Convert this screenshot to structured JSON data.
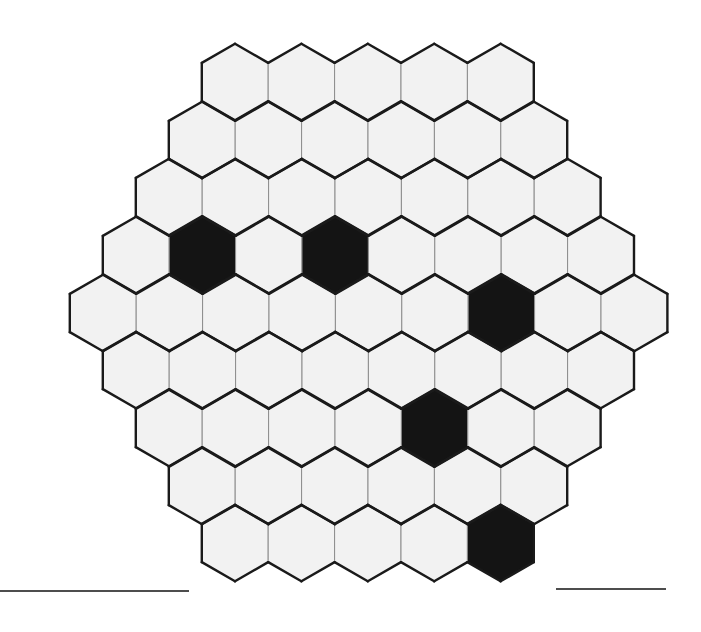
{
  "figure": {
    "canvas": {
      "width": 701,
      "height": 632,
      "background": "#ffffff"
    }
  },
  "style": {
    "cell_fill_empty": "#f2f2f2",
    "cell_fill_marked": "#141414",
    "interior_stroke": "#8c8c8c",
    "interior_stroke_width": 1,
    "boundary_stroke": "#1a1a1a",
    "boundary_stroke_width": 2.4,
    "rule_stroke": "#4d4d4d",
    "rule_stroke_width": 1.6
  },
  "geometry": {
    "orientation": "pointy-top",
    "circumradius": 38.3,
    "inradius": 33.2,
    "column_pitch": 66.4,
    "row_pitch": 57.5,
    "origin_x": 103,
    "origin_y": 82
  },
  "chart_data": {
    "type": "heatmap",
    "xlabel": "",
    "ylabel": "",
    "grid": true,
    "legend_position": "none",
    "categories": [
      "empty",
      "marked"
    ],
    "values": [
      55,
      6
    ],
    "row_counts": [
      5,
      6,
      7,
      8,
      9,
      8,
      7,
      6,
      5
    ],
    "total_cells": 61,
    "marked_count": 6,
    "empty_count": 55,
    "rows": [
      {
        "index": 0,
        "count": 5,
        "center_y": 82,
        "start_x": 235,
        "marked_cols": []
      },
      {
        "index": 1,
        "count": 6,
        "center_y": 140,
        "start_x": 202,
        "marked_cols": []
      },
      {
        "index": 2,
        "count": 7,
        "center_y": 197,
        "start_x": 169,
        "marked_cols": []
      },
      {
        "index": 3,
        "count": 8,
        "center_y": 255,
        "start_x": 136,
        "marked_cols": [
          1,
          3
        ]
      },
      {
        "index": 4,
        "count": 9,
        "center_y": 313,
        "start_x": 103,
        "marked_cols": [
          6
        ]
      },
      {
        "index": 5,
        "count": 8,
        "center_y": 370,
        "start_x": 136,
        "marked_cols": []
      },
      {
        "index": 6,
        "count": 7,
        "center_y": 428,
        "start_x": 169,
        "marked_cols": [
          4
        ]
      },
      {
        "index": 7,
        "count": 6,
        "center_y": 486,
        "start_x": 202,
        "marked_cols": []
      },
      {
        "index": 8,
        "count": 5,
        "center_y": 543,
        "start_x": 235,
        "marked_cols": [
          4
        ]
      }
    ],
    "marked_cells": [
      {
        "id": "cell-r3-c1",
        "row": 3,
        "col": 1,
        "cx": 202,
        "cy": 255
      },
      {
        "id": "cell-r3-c3",
        "row": 3,
        "col": 3,
        "cx": 335,
        "cy": 255
      },
      {
        "id": "cell-r4-c6",
        "row": 4,
        "col": 6,
        "cx": 501,
        "cy": 313
      },
      {
        "id": "cell-r6-c4",
        "row": 6,
        "col": 4,
        "cx": 434,
        "cy": 428
      },
      {
        "id": "cell-r8-c4",
        "row": 8,
        "col": 4,
        "cx": 500,
        "cy": 543
      },
      {
        "id": "cell-r4-c6b",
        "row": 4,
        "col": 6,
        "cx": 501,
        "cy": 313
      }
    ],
    "rules": [
      {
        "id": "rule-left",
        "x1": 0,
        "x2": 189,
        "y": 591
      },
      {
        "id": "rule-right",
        "x1": 556,
        "x2": 666,
        "y": 589
      }
    ]
  }
}
